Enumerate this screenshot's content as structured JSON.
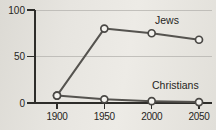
{
  "figure": {
    "background": "#e4e2dd"
  },
  "chart_data": {
    "type": "line",
    "title": "",
    "x": [
      1900,
      1950,
      2000,
      2050
    ],
    "xtick_labels": [
      "1900",
      "1950",
      "2000",
      "2050"
    ],
    "xlim": [
      1900,
      2050
    ],
    "yticks": [
      0,
      50,
      100
    ],
    "ytick_labels": [
      "0",
      "50",
      "100"
    ],
    "ylim": [
      0,
      100
    ],
    "grid": "horizontal gridlines at 50 and 100",
    "legend_position": "inline-labels-near-lines",
    "series": [
      {
        "name": "Jews",
        "values": [
          8,
          80,
          75,
          68
        ],
        "color": "#55534f"
      },
      {
        "name": "Christians",
        "values": [
          8,
          4,
          2,
          1
        ],
        "color": "#55534f"
      }
    ],
    "colors": {
      "axis": "#2e2d2a",
      "grid": "#b4b2ae",
      "text": "#262522",
      "marker_fill": "#f3f2ee",
      "marker_stroke": "#4a4845"
    }
  }
}
